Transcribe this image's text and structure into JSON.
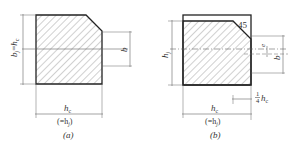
{
  "figure_a": {
    "caption": "(a)",
    "left_dim_label": "b_j = h_c",
    "left_dim_main": "b",
    "left_dim_sub": "j",
    "left_dim_eq": "=",
    "left_dim_rhs": "h",
    "left_dim_rhs_sub": "c",
    "right_dim_label": "b",
    "bottom_dim_main": "h",
    "bottom_dim_sub": "c",
    "bottom_dim_paren": "(=h",
    "bottom_dim_paren_sub": "j",
    "bottom_dim_paren_close": ")"
  },
  "figure_b": {
    "caption": "(b)",
    "angle_label": "45",
    "left_dim_main": "h",
    "left_dim_sub": "j",
    "right_dim_e": "e",
    "right_dim_b": "b",
    "quarter_num": "1",
    "quarter_den": "4",
    "quarter_h": "h",
    "quarter_sub": "c",
    "bottom_dim_main": "h",
    "bottom_dim_sub": "c",
    "bottom_dim_paren": "(=h",
    "bottom_dim_paren_sub": "j",
    "bottom_dim_paren_close": ")"
  },
  "colors": {
    "outline": "#222222",
    "hatch": "#888888",
    "dim_line": "#666666",
    "text": "#333333"
  }
}
